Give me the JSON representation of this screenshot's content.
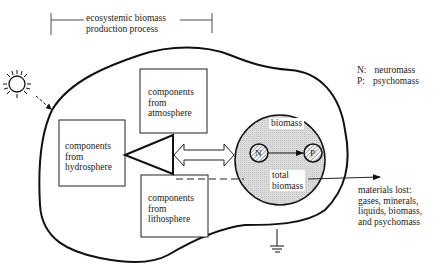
{
  "title": {
    "line1": "ecosystemic biomass",
    "line2": "production process"
  },
  "legend": [
    {
      "key": "N:",
      "value": "neuromass"
    },
    {
      "key": "P:",
      "value": "psychomass"
    }
  ],
  "boxes": {
    "atmosphere": {
      "line1": "components",
      "line2": "from",
      "line3": "atmosphere"
    },
    "hydrosphere": {
      "line1": "components",
      "line2": "from",
      "line3": "hydrosphere"
    },
    "lithosphere": {
      "line1": "components",
      "line2": "from",
      "line3": "lithosphere"
    }
  },
  "circle": {
    "biomass_label": "biomass",
    "total_line1": "total",
    "total_line2": "biomass",
    "node_n": "N",
    "node_p": "P",
    "fill_color": "#d9d9d9"
  },
  "materials_lost": {
    "line1": "materials lost:",
    "line2": "gases, minerals,",
    "line3": "liquids, biomass,",
    "line4": "and psychomass"
  },
  "icons": [
    "sun-icon",
    "ground-icon",
    "double-arrow-icon"
  ]
}
